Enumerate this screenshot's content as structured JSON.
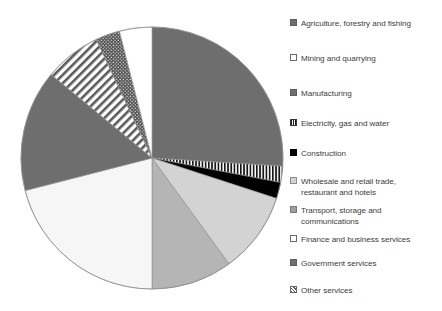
{
  "chart_data": {
    "type": "pie",
    "title": "",
    "subtitle": "",
    "xlabel": "",
    "ylabel": "",
    "grid": false,
    "legend_position": "right",
    "start_angle_deg": 0,
    "direction": "clockwise",
    "center": {
      "x": 152,
      "y": 158
    },
    "radius": 131,
    "categories": [
      "Agriculture, forestry and fishing",
      "Electricity, gas and water",
      "Construction",
      "Wholesale and retail trade, restaurant and hotels",
      "Transport, storage and communications",
      "Finance and business services",
      "Government services",
      "Other services",
      "Mining and quarrying",
      "Manufacturing"
    ],
    "values": [
      26,
      2,
      2,
      10,
      10,
      21,
      15,
      7,
      3,
      4
    ],
    "slices": [
      {
        "label": "Agriculture, forestry and fishing",
        "value": 26,
        "start_deg": 0,
        "end_deg": 93.6,
        "fill": "solid",
        "color": "#6e6e6e"
      },
      {
        "label": "Electricity, gas and water",
        "value": 2,
        "start_deg": 93.6,
        "end_deg": 100.8,
        "fill": "vertical-stripes",
        "color": "#1a1a1a"
      },
      {
        "label": "Construction",
        "value": 2,
        "start_deg": 100.8,
        "end_deg": 108.0,
        "fill": "solid",
        "color": "#000000"
      },
      {
        "label": "Wholesale and retail trade, restaurant and hotels",
        "value": 10,
        "start_deg": 108.0,
        "end_deg": 144.0,
        "fill": "solid",
        "color": "#d3d3d3"
      },
      {
        "label": "Transport, storage and communications",
        "value": 10,
        "start_deg": 144.0,
        "end_deg": 180.0,
        "fill": "solid",
        "color": "#b5b5b5"
      },
      {
        "label": "Finance and business services",
        "value": 21,
        "start_deg": 180.0,
        "end_deg": 255.6,
        "fill": "solid",
        "color": "#f6f6f6"
      },
      {
        "label": "Government services",
        "value": 15,
        "start_deg": 255.6,
        "end_deg": 309.6,
        "fill": "solid",
        "color": "#6e6e6e"
      },
      {
        "label": "Other services",
        "value": 7,
        "start_deg": 309.6,
        "end_deg": 334.8,
        "fill": "diagonal-hatch",
        "color": "#555555"
      },
      {
        "label": "Mining and quarrying",
        "value": 3,
        "start_deg": 334.8,
        "end_deg": 345.6,
        "fill": "dotted",
        "color": "#4a4a4a"
      },
      {
        "label": "Manufacturing",
        "value": 4,
        "start_deg": 345.6,
        "end_deg": 360.0,
        "fill": "solid",
        "color": "#ffffff"
      }
    ]
  },
  "legend": {
    "items": [
      {
        "label": "Agriculture, forestry and fishing",
        "swatch": "solid-gray",
        "color": "#6e6e6e"
      },
      {
        "label": "Mining and quarrying",
        "swatch": "outline-white",
        "color": "#ffffff"
      },
      {
        "label": "Manufacturing",
        "swatch": "solid-gray",
        "color": "#6e6e6e"
      },
      {
        "label": "Electricity, gas and water",
        "swatch": "vertical-stripes",
        "color": "#1a1a1a"
      },
      {
        "label": "Construction",
        "swatch": "solid-black",
        "color": "#000000"
      },
      {
        "label": "Wholesale and retail trade,\nrestaurant and hotels",
        "swatch": "solid-light-gray",
        "color": "#d3d3d3"
      },
      {
        "label": "Transport, storage and\ncommunications",
        "swatch": "solid-medium-gray",
        "color": "#b5b5b5"
      },
      {
        "label": "Finance and business services",
        "swatch": "outline-white",
        "color": "#f6f6f6"
      },
      {
        "label": "Government services",
        "swatch": "solid-gray",
        "color": "#6e6e6e"
      },
      {
        "label": "Other services",
        "swatch": "diagonal-hatch",
        "color": "#555555"
      }
    ]
  }
}
